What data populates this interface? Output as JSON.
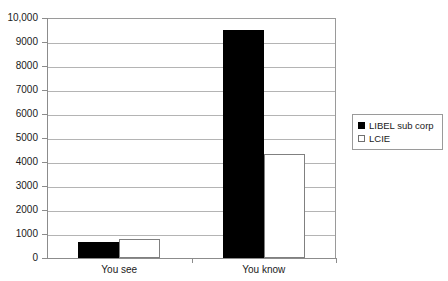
{
  "chart_data": {
    "type": "bar",
    "title": "",
    "subtitle": "",
    "xlabel": "",
    "ylabel": "",
    "categories": [
      "You see",
      "You know"
    ],
    "series": [
      {
        "name": "LIBEL sub corp",
        "values": [
          670,
          9500
        ],
        "color": "#000000"
      },
      {
        "name": "LCIE",
        "values": [
          800,
          4330
        ],
        "color": "#ffffff"
      }
    ],
    "ylim": [
      0,
      10000
    ],
    "y_ticks": [
      0,
      1000,
      2000,
      3000,
      4000,
      5000,
      6000,
      7000,
      8000,
      9000,
      10000
    ],
    "y_tick_labels": [
      "0",
      "1000",
      "2000",
      "3000",
      "4000",
      "5000",
      "6000",
      "7000",
      "8000",
      "9000",
      "10,000"
    ],
    "grid": true,
    "grid_axis": "y",
    "legend_position": "right"
  },
  "legend": {
    "items": [
      {
        "label": "LIBEL sub corp",
        "swatch": "filled-square-black"
      },
      {
        "label": "LCIE",
        "swatch": "open-square-white"
      }
    ]
  },
  "colors": {
    "series_0": "#000000",
    "series_1": "#ffffff",
    "gridline": "#b4b4b4",
    "axis": "#8c8c8c",
    "plot_background": "#ffffff",
    "text": "#1a1a1a"
  }
}
